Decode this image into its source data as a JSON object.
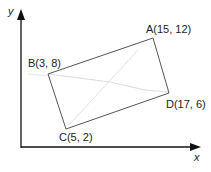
{
  "diagram": {
    "type": "coordinate-geometry-rectangle",
    "axes": {
      "x_label": "x",
      "y_label": "y"
    },
    "points": [
      {
        "name": "A",
        "label": "A(15, 12)",
        "x": 15,
        "y": 12
      },
      {
        "name": "B",
        "label": "B(3, 8)",
        "x": 3,
        "y": 8
      },
      {
        "name": "C",
        "label": "C(5, 2)",
        "x": 5,
        "y": 2
      },
      {
        "name": "D",
        "label": "D(17, 6)",
        "x": 17,
        "y": 6
      }
    ],
    "shape": {
      "vertices_order": [
        "A",
        "B",
        "C",
        "D"
      ],
      "stroke_color": "#555555",
      "faint_line_color": "#d8d8d8"
    },
    "axis_color": "#111111"
  }
}
